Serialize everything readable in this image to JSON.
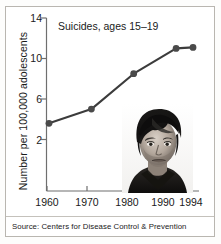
{
  "figure": {
    "source_note": "Source: Centers for Disease Control & Prevention",
    "photo_alt": "teenage-boy-portrait"
  },
  "chart_data": {
    "type": "line",
    "title": "Suicides, ages 15–19",
    "xlabel": "",
    "ylabel": "Number per 100,000 adolescents",
    "x": [
      1960,
      1970,
      1980,
      1990,
      1994
    ],
    "values": [
      3.6,
      5.0,
      8.5,
      11.0,
      11.1
    ],
    "xtick_labels": [
      "1960",
      "1970",
      "1980",
      "1990",
      "1994"
    ],
    "ytick_labels": [
      "2",
      "6",
      "10",
      "14"
    ],
    "ytick_values": [
      2,
      6,
      10,
      14
    ],
    "xlim": [
      1958,
      1996
    ],
    "ylim": [
      0,
      14
    ],
    "grid": false,
    "legend": "none",
    "line_color": "#3c3c3c",
    "marker_color": "#4a4a4a",
    "marker": "circle"
  }
}
